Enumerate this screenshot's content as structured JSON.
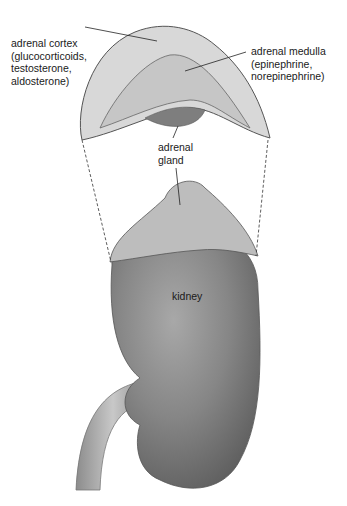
{
  "diagram": {
    "labels": {
      "cortex": "adrenal cortex\n(glucocorticoids,\ntestosterone,\naldosterone)",
      "medulla": "adrenal medulla\n(epinephrine,\nnorepinephrine)",
      "gland": "adrenal\ngland",
      "kidney": "kidney"
    }
  }
}
